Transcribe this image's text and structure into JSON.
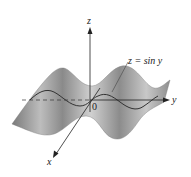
{
  "figure": {
    "equation_label": "z = sin y",
    "axes": {
      "x": "x",
      "y": "y",
      "z": "z"
    },
    "origin_label": "0"
  },
  "colors": {
    "surface_dark": "#6e6e6e",
    "surface_light": "#d8d8d8",
    "curve": "#333333",
    "axis": "#222222"
  }
}
